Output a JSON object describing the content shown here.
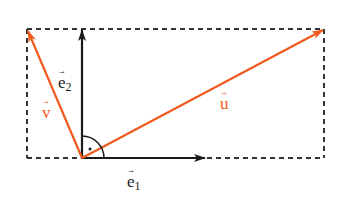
{
  "diagram": {
    "colors": {
      "basis": "#1a1a1a",
      "vectors": "#f05a1e",
      "dashed": "#333333",
      "background": "#ffffff"
    },
    "origin": [
      82,
      158
    ],
    "rectangle": {
      "x1": 27,
      "y1": 29,
      "x2": 324,
      "y2": 158,
      "style": "dashed"
    },
    "labels": {
      "e1": {
        "base": "e",
        "sub": "1"
      },
      "e2": {
        "base": "e",
        "sub": "2"
      },
      "u": {
        "base": "u"
      },
      "v": {
        "base": "v"
      }
    },
    "vectors": [
      {
        "name": "e1",
        "from": [
          82,
          158
        ],
        "to": [
          205,
          158
        ],
        "color": "basis"
      },
      {
        "name": "e2",
        "from": [
          82,
          158
        ],
        "to": [
          82,
          29
        ],
        "color": "basis"
      },
      {
        "name": "u",
        "from": [
          82,
          158
        ],
        "to": [
          324,
          29
        ],
        "color": "vectors"
      },
      {
        "name": "v",
        "from": [
          82,
          158
        ],
        "to": [
          27,
          29
        ],
        "color": "vectors"
      }
    ],
    "right_angle_marker": {
      "at": [
        82,
        158
      ],
      "type": "arc-with-dot"
    }
  }
}
